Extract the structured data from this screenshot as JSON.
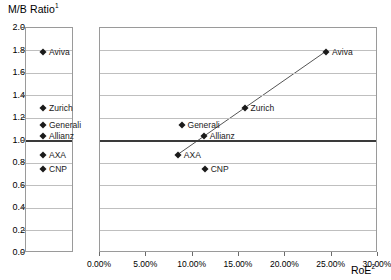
{
  "chart_data": {
    "type": "scatter",
    "title": "",
    "ylabel": "M/B Ratio",
    "ylabel_sup": "1",
    "xlabel": "RoE",
    "xlabel_sup": "2",
    "xlim": [
      0,
      30
    ],
    "ylim": [
      0.0,
      2.0
    ],
    "xtick_labels": [
      "0.00%",
      "5.00%",
      "10.00%",
      "15.00%",
      "20.00%",
      "25.00%",
      "30.00%"
    ],
    "xtick_values": [
      0,
      5,
      10,
      15,
      20,
      25,
      30
    ],
    "ytick_labels": [
      "0.0",
      "0.2",
      "0.4",
      "0.6",
      "0.8",
      "1.0",
      "1.2",
      "1.4",
      "1.6",
      "1.8",
      "2.0"
    ],
    "ytick_values": [
      0.0,
      0.2,
      0.4,
      0.6,
      0.8,
      1.0,
      1.2,
      1.4,
      1.6,
      1.8,
      2.0
    ],
    "grid": true,
    "legend_position": "left-panel",
    "reference_line": {
      "name": "parity-line",
      "y": 1.0,
      "color": "#3a3a3a",
      "width": 2
    },
    "trendline": {
      "name": "regression-line",
      "color": "#555555",
      "x0": 8.2,
      "y0": 0.865,
      "x1": 24.5,
      "y1": 1.8
    },
    "points": [
      {
        "label": "Aviva",
        "x": 24.4,
        "y": 1.79,
        "label_side": "right"
      },
      {
        "label": "Zurich",
        "x": 15.6,
        "y": 1.29,
        "label_side": "right"
      },
      {
        "label": "Generali",
        "x": 8.8,
        "y": 1.14,
        "label_side": "right"
      },
      {
        "label": "Allianz",
        "x": 11.2,
        "y": 1.04,
        "label_side": "right"
      },
      {
        "label": "AXA",
        "x": 8.4,
        "y": 0.875,
        "label_side": "right"
      },
      {
        "label": "CNP",
        "x": 11.3,
        "y": 0.75,
        "label_side": "right"
      }
    ],
    "legend_panel": {
      "name": "mb-ratio-column",
      "points": [
        {
          "label": "Aviva",
          "y": 1.79
        },
        {
          "label": "Zurich",
          "y": 1.29
        },
        {
          "label": "Generali",
          "y": 1.14
        },
        {
          "label": "Allianz",
          "y": 1.04
        },
        {
          "label": "AXA",
          "y": 0.875
        },
        {
          "label": "CNP",
          "y": 0.75
        }
      ]
    }
  },
  "footnote": ""
}
